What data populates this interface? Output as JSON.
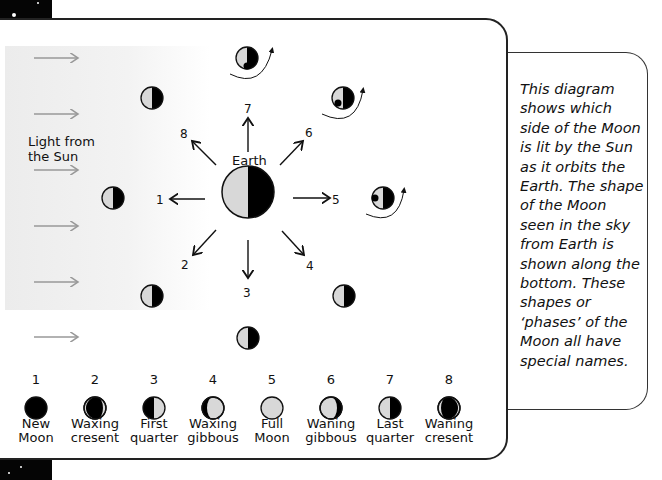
{
  "diagram": {
    "sun_label": "Light from the Sun",
    "earth_label": "Earth",
    "position_labels": [
      "1",
      "2",
      "3",
      "4",
      "5",
      "6",
      "7",
      "8"
    ],
    "description": "This diagram shows which side of the Moon is lit by the Sun as it orbits the Earth. The shape of the Moon seen in the sky from Earth is shown along the bottom. These shapes or ‘phases’ of the Moon all have special names."
  },
  "phases": [
    {
      "num": "1",
      "line1": "New",
      "line2": "Moon",
      "lit": "none"
    },
    {
      "num": "2",
      "line1": "Waxing",
      "line2": "cresent",
      "lit": "right-crescent"
    },
    {
      "num": "3",
      "line1": "First",
      "line2": "quarter",
      "lit": "right-half"
    },
    {
      "num": "4",
      "line1": "Waxing",
      "line2": "gibbous",
      "lit": "right-gibbous"
    },
    {
      "num": "5",
      "line1": "Full",
      "line2": "Moon",
      "lit": "full"
    },
    {
      "num": "6",
      "line1": "Waning",
      "line2": "gibbous",
      "lit": "left-gibbous"
    },
    {
      "num": "7",
      "line1": "Last",
      "line2": "quarter",
      "lit": "left-half"
    },
    {
      "num": "8",
      "line1": "Waning",
      "line2": "cresent",
      "lit": "left-crescent"
    }
  ],
  "colors": {
    "lit": "#d8d8d8",
    "dark": "#000000",
    "sun_band": "#ececec",
    "arrow_grey": "#999999"
  }
}
